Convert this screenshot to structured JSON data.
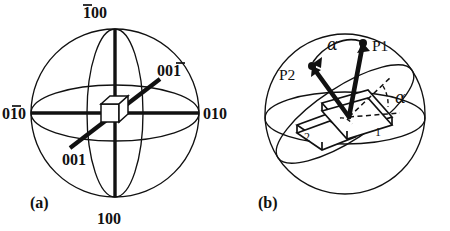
{
  "figure": {
    "background_color": "#ffffff",
    "ink_color": "#111111",
    "panels": [
      {
        "id": "panel-a",
        "caption": "(a)",
        "description": "Stereographic sphere with cubic unit cell at centre and crystallographic direction labels",
        "axis_labels": [
          {
            "name": "top",
            "text": "100",
            "overbar_index": 0,
            "display": "̀1̅ 0 0"
          },
          {
            "name": "bottom",
            "text": "100",
            "overbar_index": -1,
            "display": "100"
          },
          {
            "name": "left",
            "text": "010",
            "overbar_index": 1,
            "display": "0 1̅ 0"
          },
          {
            "name": "right",
            "text": "010",
            "overbar_index": -1,
            "display": "010"
          },
          {
            "name": "upper-right-diagonal",
            "text": "001",
            "overbar_index": 2,
            "display": "0 0 1̅"
          },
          {
            "name": "lower-left-diagonal",
            "text": "001",
            "overbar_index": -1,
            "display": "001"
          }
        ],
        "center_object": "cube"
      },
      {
        "id": "panel-b",
        "caption": "(b)",
        "description": "Sphere with two pole vectors P1 and P2, rotation angle alpha between them, and two lattice planes 1 and 2",
        "point_labels": [
          {
            "name": "pole-1",
            "text": "P1"
          },
          {
            "name": "pole-2",
            "text": "P2"
          }
        ],
        "angle_labels": [
          {
            "name": "alpha-between-poles",
            "text": "α"
          },
          {
            "name": "alpha-in-plane",
            "text": "α"
          }
        ],
        "plane_labels": [
          {
            "name": "plane-1",
            "text": "1"
          },
          {
            "name": "plane-2",
            "text": "2"
          }
        ]
      }
    ]
  },
  "labels": {
    "a": {
      "top": "100",
      "top_bar_digit": "1",
      "top_rest": "00",
      "bottom": "100",
      "left_first": "0",
      "left_bar_digit": "1",
      "left_rest": "0",
      "right": "010",
      "diag_ur_lead": "00",
      "diag_ur_bar_digit": "1",
      "diag_ll": "001",
      "caption": "(a)"
    },
    "b": {
      "p1": "P1",
      "p2": "P2",
      "alpha_arc": "α",
      "alpha_plane": "α",
      "plane1": "1",
      "plane2": "2",
      "caption": "(b)"
    }
  }
}
